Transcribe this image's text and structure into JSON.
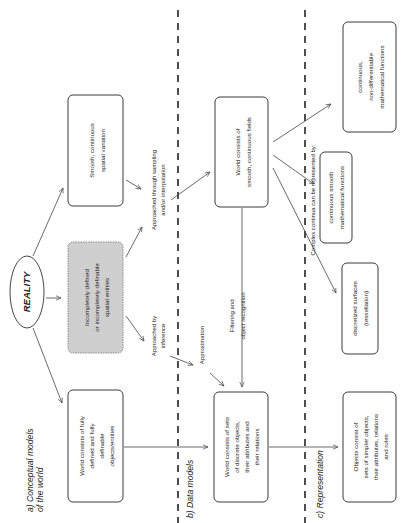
{
  "diagram": {
    "orientation": "rotated-90-ccw",
    "colors": {
      "background": "#ffffff",
      "box_border": "#3a3a3a",
      "grey_box_fill": "#cfcfcf",
      "divider": "#222222",
      "text": "#222222"
    },
    "sections": [
      {
        "id": "a",
        "label_line1": "a) Conceptual models",
        "label_line2": "of the world"
      },
      {
        "id": "b",
        "label": "b) Data models"
      },
      {
        "id": "c",
        "label": "c) Representation"
      }
    ],
    "root": {
      "label": "REALITY"
    },
    "boxes": {
      "smooth_variation": {
        "lines": [
          "Smooth, continuous",
          "spatial variation"
        ]
      },
      "incompletely_defined": {
        "lines": [
          "Incompletely defined",
          "or incompletely definable",
          "spatial entities"
        ]
      },
      "fully_defined": {
        "lines": [
          "World consists of fully",
          "defined and fully",
          "definable",
          "objects/entities"
        ]
      },
      "continuous_fields": {
        "lines": [
          "World consists of",
          "smooth, continuous fields"
        ]
      },
      "discrete_objects": {
        "lines": [
          "World consists of sets",
          "of discrete objects,",
          "their attributes and",
          "their relations"
        ]
      },
      "non_differentiable": {
        "lines": [
          "continuous,",
          "non-differentiable",
          "mathematical functions"
        ]
      },
      "smooth_functions": {
        "lines": [
          "continuous smooth",
          "mathematical functions"
        ]
      },
      "discretized_surfaces": {
        "lines": [
          "discretized surfaces",
          "(tessellation)"
        ]
      },
      "simpler_objects": {
        "lines": [
          "Objects consist of",
          "sets of simpler objects,",
          "their attributes, relations",
          "and rules"
        ]
      }
    },
    "edge_labels": {
      "sampling": {
        "lines": [
          "Approached through sampling",
          "and/or interpolation"
        ]
      },
      "inference": {
        "lines": [
          "Approached by",
          "inference"
        ]
      },
      "approximation": {
        "lines": [
          "Approximation"
        ]
      },
      "filtering": {
        "lines": [
          "Filtering and",
          "object recognition"
        ]
      },
      "complex_continua": {
        "lines": [
          "Complex continua can be represented by:"
        ]
      }
    }
  }
}
